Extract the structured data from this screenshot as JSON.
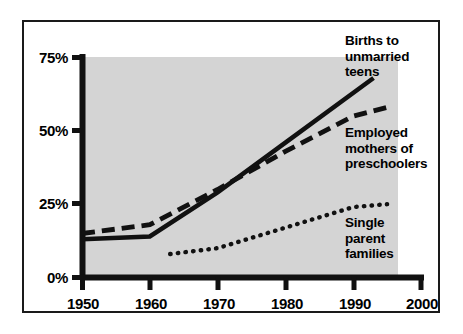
{
  "chart_data": {
    "type": "line",
    "title": "",
    "subtitle": "",
    "xlabel": "",
    "ylabel": "",
    "xlim": [
      1950,
      2000
    ],
    "ylim": [
      0,
      75
    ],
    "grid": false,
    "legend_position": "inline-right",
    "x_tick_labels": [
      "1950",
      "1960",
      "1970",
      "1980",
      "1990",
      "2000"
    ],
    "x_ticks": [
      1950,
      1960,
      1970,
      1980,
      1990,
      2000
    ],
    "y_tick_labels": [
      "0%",
      "25%",
      "50%",
      "75%"
    ],
    "y_ticks": [
      0,
      25,
      50,
      75
    ],
    "series": [
      {
        "name": "Births to unmarried teens",
        "style": "solid",
        "label_lines": [
          "Births to",
          "unmarried",
          "teens"
        ],
        "x": [
          1950,
          1960,
          1970,
          1980,
          1993
        ],
        "values": [
          13,
          14,
          29,
          46,
          68
        ]
      },
      {
        "name": "Employed mothers of preschoolers",
        "style": "dashed",
        "label_lines": [
          "Employed",
          "mothers of",
          "preschoolers"
        ],
        "x": [
          1950,
          1960,
          1970,
          1980,
          1990,
          1995
        ],
        "values": [
          15,
          18,
          30,
          43,
          55,
          58
        ]
      },
      {
        "name": "Single parent families",
        "style": "dotted",
        "label_lines": [
          "Single",
          "parent",
          "families"
        ],
        "x": [
          1963,
          1970,
          1980,
          1990,
          1995
        ],
        "values": [
          8,
          10,
          17,
          24,
          25
        ]
      }
    ]
  },
  "axes": {
    "y_labels": [
      "75%",
      "50%",
      "25%",
      "0%"
    ],
    "x_labels": [
      "1950",
      "1960",
      "1970",
      "1980",
      "1990",
      "2000"
    ]
  },
  "labels": {
    "series_1_line_1": "Births to",
    "series_1_line_2": "unmarried",
    "series_1_line_3": "teens",
    "series_2_line_1": "Employed",
    "series_2_line_2": "mothers of",
    "series_2_line_3": "preschoolers",
    "series_3_line_1": "Single",
    "series_3_line_2": "parent",
    "series_3_line_3": "families"
  },
  "colors": {
    "background": "#ffffff",
    "plot_background": "#d4d4d4",
    "ink": "#111111",
    "frame": "#1a1a1a"
  }
}
